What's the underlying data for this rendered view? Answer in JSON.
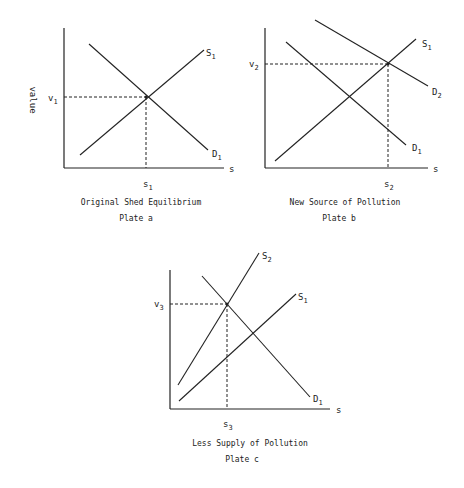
{
  "y_axis_label": "value",
  "x_axis_symbol": "s",
  "plates": [
    {
      "id": "a",
      "caption": "Original Shed Equilibrium",
      "plate_label": "Plate a",
      "v_label": "v",
      "v_sub": "1",
      "s_label": "s",
      "s_sub": "1",
      "curves": [
        {
          "name": "S",
          "sub": "1"
        },
        {
          "name": "D",
          "sub": "1"
        }
      ]
    },
    {
      "id": "b",
      "caption": "New Source of Pollution",
      "plate_label": "Plate b",
      "v_label": "v",
      "v_sub": "2",
      "s_label": "s",
      "s_sub": "2",
      "curves": [
        {
          "name": "S",
          "sub": "1"
        },
        {
          "name": "D",
          "sub": "2"
        },
        {
          "name": "D",
          "sub": "1"
        }
      ]
    },
    {
      "id": "c",
      "caption": "Less Supply of Pollution",
      "plate_label": "Plate c",
      "v_label": "v",
      "v_sub": "3",
      "s_label": "s",
      "s_sub": "3",
      "curves": [
        {
          "name": "S",
          "sub": "2"
        },
        {
          "name": "S",
          "sub": "1"
        },
        {
          "name": "D",
          "sub": "1"
        }
      ]
    }
  ]
}
